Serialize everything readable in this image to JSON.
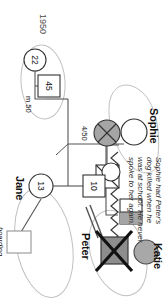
{
  "diagram": {
    "type": "genogram",
    "year_label": "1950",
    "annotation": {
      "line1": "Sophie had Peter's",
      "line2": "dog killed when he",
      "line3": "was at school. He never",
      "line4": "spoke to her again."
    },
    "people": [
      {
        "id": "sophie",
        "name": "Sophie",
        "symbol": "circle",
        "fill": "white",
        "age": "",
        "status": "alive"
      },
      {
        "id": "katie",
        "name": "Katie",
        "symbol": "circle",
        "fill": "gray",
        "age": "",
        "status": "alive"
      },
      {
        "id": "peter",
        "name": "Peter",
        "symbol": "square",
        "fill": "gray",
        "age": "",
        "status": "deceased"
      },
      {
        "id": "jane",
        "name": "Jane",
        "symbol": "circle",
        "fill": "white",
        "age": "13",
        "status": "alive"
      },
      {
        "id": "peter-child",
        "name": "",
        "symbol": "square",
        "fill": "white",
        "age": "10",
        "status": "alive"
      },
      {
        "id": "father-45",
        "name": "",
        "symbol": "square",
        "fill": "white",
        "age": "45",
        "status": "alive"
      },
      {
        "id": "mother-22",
        "name": "",
        "symbol": "circle",
        "fill": "white",
        "age": "22",
        "status": "alive"
      },
      {
        "id": "deceased-male",
        "name": "",
        "symbol": "square",
        "fill": "white",
        "age": "",
        "status": "deceased"
      },
      {
        "id": "boarding-school-box",
        "name": "",
        "symbol": "square",
        "fill": "white",
        "age": "",
        "status": "alive"
      }
    ],
    "relationship_labels": {
      "marriage": "m 50",
      "divorce": "4/50"
    },
    "notes": {
      "boarding_school_line1": "boarding",
      "boarding_school_line2": "school"
    },
    "colors": {
      "line": "#5a5a5a",
      "line_dark": "#2d2d2d",
      "fill_gray": "#9a9a9a",
      "fill_white": "#ffffff",
      "household_outline": "#b9b9b9",
      "text": "#111111"
    }
  }
}
